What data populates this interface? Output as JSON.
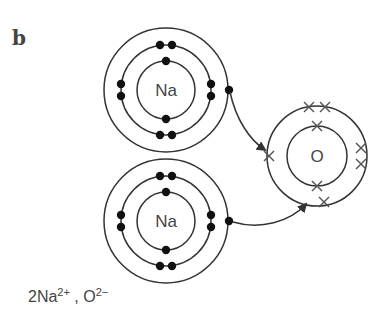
{
  "figure": {
    "panel_label": "b",
    "caption": {
      "part1_base": "2Na",
      "part1_charge": "2+",
      "separator": " , ",
      "part2_base": "O",
      "part2_charge": "2−"
    },
    "atoms": [
      {
        "symbol": "Na",
        "shells": [
          2,
          8,
          1
        ],
        "electron_marker": "dot",
        "position": "top-left"
      },
      {
        "symbol": "Na",
        "shells": [
          2,
          8,
          1
        ],
        "electron_marker": "dot",
        "position": "bottom-left"
      },
      {
        "symbol": "O",
        "shells": [
          2,
          6
        ],
        "electron_marker": "cross",
        "position": "right"
      }
    ],
    "arrows": [
      {
        "from": "Na (top) outer electron",
        "to": "O outer shell (left)"
      },
      {
        "from": "Na (bottom) outer electron",
        "to": "O outer shell (bottom)"
      }
    ],
    "colors": {
      "line": "#333333",
      "text": "#444444",
      "background": "#ffffff"
    }
  }
}
